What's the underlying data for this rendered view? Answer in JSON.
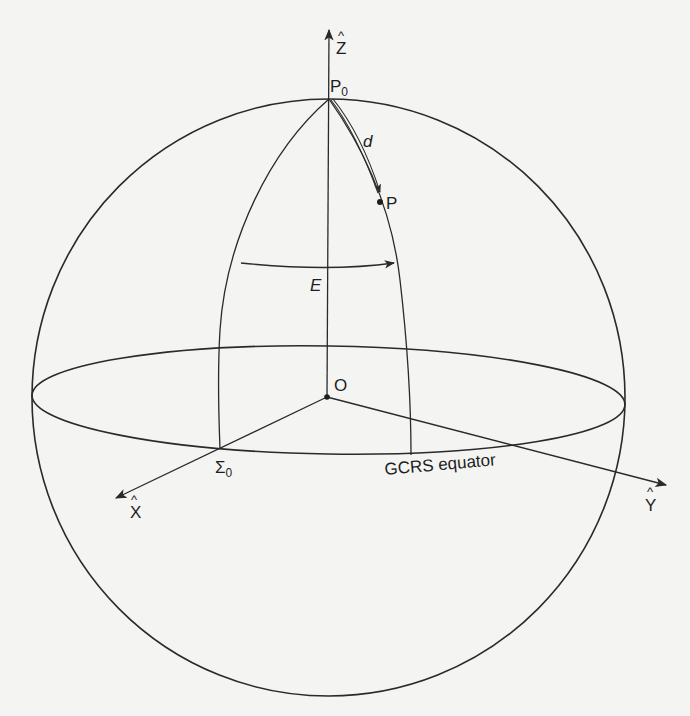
{
  "diagram": {
    "type": "celestial-sphere-geometry",
    "background_color": "#f4f4f2",
    "line_color": "#2a2a2a",
    "labels": {
      "z_axis": "Z",
      "z_axis_hat": "^",
      "x_axis": "X",
      "x_axis_hat": "^",
      "y_axis": "Y",
      "y_axis_hat": "^",
      "pole_point": "P",
      "pole_point_subscript": "0",
      "point": "P",
      "arc_distance": "d",
      "angle": "E",
      "origin": "O",
      "equator_origin": "Σ",
      "equator_origin_subscript": "0",
      "equator": "GCRS equator"
    },
    "elements": [
      {
        "name": "sphere",
        "kind": "circle outline"
      },
      {
        "name": "equator",
        "kind": "ellipse",
        "label": "GCRS equator"
      },
      {
        "name": "z-axis",
        "kind": "arrow",
        "from": "O",
        "to": "Z"
      },
      {
        "name": "x-axis",
        "kind": "arrow",
        "from": "O",
        "through": "Σ0",
        "to": "X"
      },
      {
        "name": "y-axis",
        "kind": "arrow",
        "from": "O",
        "to": "Y"
      },
      {
        "name": "meridian-sigma0",
        "kind": "arc",
        "from": "P0",
        "to": "Σ0 on equator"
      },
      {
        "name": "meridian-p",
        "kind": "arc",
        "from": "P0",
        "through": "P",
        "to": "equator"
      },
      {
        "name": "arc-d",
        "kind": "double-line arrow",
        "from": "P0",
        "to": "P"
      },
      {
        "name": "angle-e",
        "kind": "arc arrow",
        "from": "meridian-sigma0",
        "to": "meridian-p"
      }
    ]
  }
}
